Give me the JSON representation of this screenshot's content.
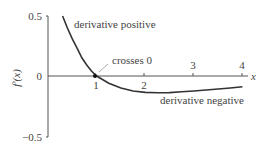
{
  "chart_data": {
    "type": "line",
    "title": "",
    "xlabel": "x",
    "ylabel": "f'(x)",
    "xlim": [
      0,
      4.2
    ],
    "ylim": [
      -0.5,
      0.5
    ],
    "x_ticks": [
      "1",
      "2",
      "3",
      "4"
    ],
    "y_ticks": [
      "0.5",
      "0",
      "−0.5"
    ],
    "series": [
      {
        "name": "f'(x)",
        "x": [
          0.3,
          0.4,
          0.5,
          0.6,
          0.7,
          0.8,
          0.9,
          1.0,
          1.25,
          1.5,
          1.75,
          2.0,
          2.25,
          2.5,
          2.75,
          3.0,
          3.25,
          3.5,
          3.75,
          4.0
        ],
        "y": [
          0.5,
          0.4,
          0.31,
          0.23,
          0.15,
          0.09,
          0.04,
          0.0,
          -0.06,
          -0.1,
          -0.125,
          -0.137,
          -0.14,
          -0.138,
          -0.132,
          -0.125,
          -0.117,
          -0.108,
          -0.1,
          -0.09
        ]
      }
    ],
    "annotations": [
      {
        "text": "derivative positive",
        "x": 1.6,
        "y": 0.42
      },
      {
        "text": "crosses 0",
        "x": 1.6,
        "y": 0.1,
        "points_to": [
          1,
          0
        ]
      },
      {
        "text": "derivative negative",
        "x": 3.2,
        "y": -0.27
      }
    ],
    "grid": false,
    "legend": "none"
  }
}
